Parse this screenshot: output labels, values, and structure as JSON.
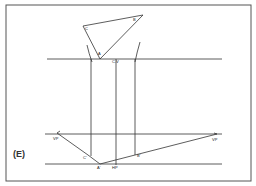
{
  "figure": {
    "panel_label": "(E)",
    "frame": {
      "x1": 6,
      "y1": 5,
      "x2": 251,
      "y2": 181,
      "color": "#555555"
    },
    "line_color": "#333333",
    "plan_triangle": {
      "points": {
        "C": [
          83,
          26
        ],
        "B": [
          143,
          15
        ],
        "A": [
          100,
          59
        ]
      },
      "labels": {
        "C": "C",
        "B": "B",
        "A": "A"
      }
    },
    "picture_plane_line": {
      "y": 59,
      "x1": 47,
      "x2": 222
    },
    "horizon_line": {
      "y": 134,
      "x1": 45,
      "x2": 222
    },
    "ground_line": {
      "y": 164,
      "x1": 45,
      "x2": 222
    },
    "projectors": [
      {
        "x": 91,
        "y1": 59,
        "y2": 156
      },
      {
        "x": 116,
        "y1": 59,
        "y2": 165
      },
      {
        "x": 135,
        "y1": 59,
        "y2": 155
      }
    ],
    "arcs": [
      {
        "d": "M87 45 Q89 54 92 62"
      },
      {
        "d": "M140 42 Q137 52 135 62"
      }
    ],
    "vanishing_lines": [
      {
        "from": [
          57,
          133
        ],
        "to": [
          88,
          155
        ]
      },
      {
        "from": [
          88,
          155
        ],
        "to": [
          100,
          164
        ]
      },
      {
        "from": [
          100,
          164
        ],
        "to": [
          135,
          155
        ]
      },
      {
        "from": [
          135,
          155
        ],
        "to": [
          217,
          134
        ]
      }
    ],
    "labels": {
      "cv": "C.V",
      "vp_left": "VP",
      "vp_right": "VP",
      "c_prime": "C'",
      "a_prime": "A'",
      "b_prime": "B'",
      "hp": "HP"
    }
  }
}
